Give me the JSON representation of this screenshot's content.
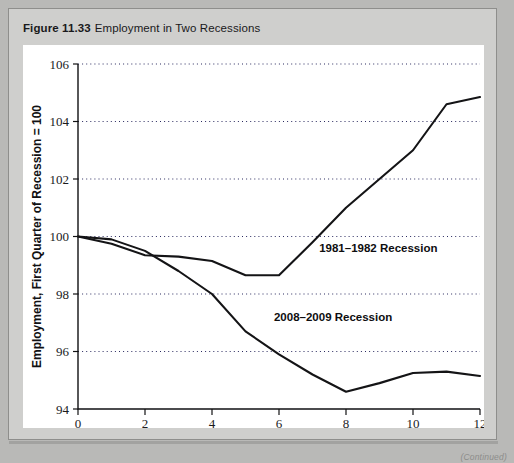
{
  "figure": {
    "number": "Figure 11.33",
    "title": "Employment in Two Recessions",
    "continued_note": "(Continued)"
  },
  "chart_data": {
    "type": "line",
    "title": "Employment in Two Recessions",
    "xlabel": "Quarters from Start of Recession",
    "ylabel": "Employment, First Quarter of Recession = 100",
    "xlim": [
      0,
      12
    ],
    "ylim": [
      94,
      106
    ],
    "xticks": [
      0,
      2,
      4,
      6,
      8,
      10,
      12
    ],
    "xticklabels": [
      "0",
      "2",
      "4",
      "6",
      "8",
      "10",
      "12"
    ],
    "yticks": [
      94,
      96,
      98,
      100,
      102,
      104,
      106
    ],
    "yticklabels": [
      "94",
      "96",
      "98",
      "100",
      "102",
      "104",
      "106"
    ],
    "grid": "horizontal-dotted",
    "legend": "inline-annotations",
    "x": [
      0,
      1,
      2,
      3,
      4,
      5,
      6,
      7,
      8,
      9,
      10,
      11,
      12
    ],
    "series": [
      {
        "name": "1981-1982 Recession",
        "label": "1981–1982 Recession",
        "label_x": 7.2,
        "label_y": 99.6,
        "values": [
          100.0,
          99.75,
          99.35,
          99.3,
          99.15,
          98.65,
          98.65,
          99.8,
          101.0,
          102.0,
          103.0,
          104.6,
          104.85
        ]
      },
      {
        "name": "2008-2009 Recession",
        "label": "2008–2009 Recession",
        "label_x": 5.85,
        "label_y": 97.2,
        "values": [
          100.0,
          99.9,
          99.5,
          98.8,
          98.0,
          96.7,
          95.9,
          95.2,
          94.6,
          94.9,
          95.25,
          95.3,
          95.15
        ]
      }
    ]
  },
  "colors": {
    "page_background": "#b9b9b7",
    "card_background": "#cfcfcd",
    "plot_background": "#ffffff",
    "line": "#141416",
    "gridline": "#2b2b60",
    "text": "#19191b"
  }
}
